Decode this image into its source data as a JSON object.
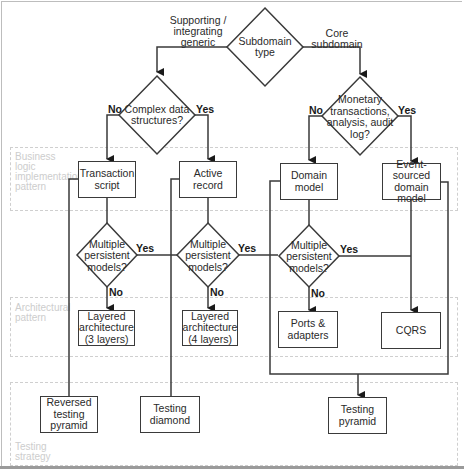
{
  "lanes": {
    "business_logic": "Business logic implementation pattern",
    "architectural": "Architectural pattern",
    "testing": "Testing strategy"
  },
  "decisions": {
    "subdomain_type": "Subdomain type",
    "complex_data": "Complex data structures?",
    "monetary": "Monetary transactions, analysis, audit log?",
    "multi_persist_1": "Multiple persistent models?",
    "multi_persist_2": "Multiple persistent models?",
    "multi_persist_3": "Multiple persistent models?"
  },
  "edges": {
    "supporting": "Supporting / integrating generic",
    "core": "Core subdomain",
    "no": "No",
    "yes": "Yes"
  },
  "nodes": {
    "transaction_script": "Transaction script",
    "active_record": "Active record",
    "domain_model": "Domain model",
    "event_sourced": "Event-sourced domain model",
    "layered_3": "Layered architecture (3 layers)",
    "layered_4": "Layered architecture (4 layers)",
    "ports_adapters": "Ports & adapters",
    "cqrs": "CQRS",
    "reversed_pyramid": "Reversed testing pyramid",
    "testing_diamond": "Testing diamond",
    "testing_pyramid": "Testing pyramid"
  },
  "colors": {
    "stroke": "#3a3a3a",
    "lane_border": "#cfcfcf",
    "lane_label": "#cdcdcd"
  }
}
